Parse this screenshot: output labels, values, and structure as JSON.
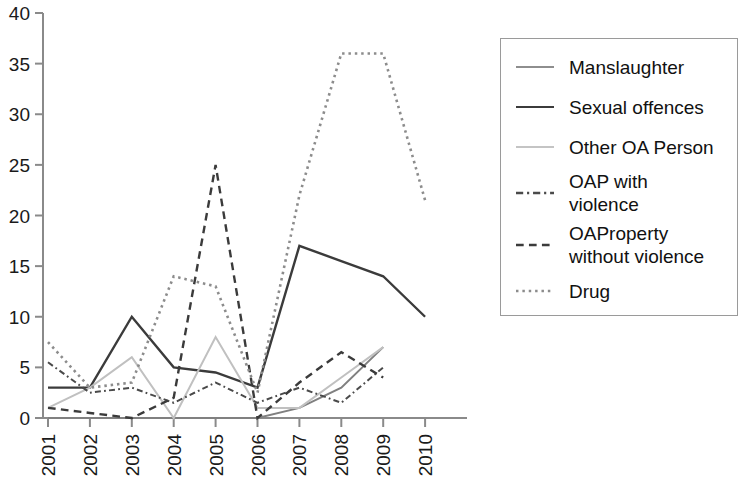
{
  "chart_data": {
    "type": "line",
    "title": "",
    "xlabel": "",
    "ylabel": "",
    "x": [
      "2001",
      "2002",
      "2003",
      "2004",
      "2005",
      "2006",
      "2007",
      "2008",
      "2009",
      "2010"
    ],
    "categories": [
      "2001",
      "2002",
      "2003",
      "2004",
      "2005",
      "2006",
      "2007",
      "2008",
      "2009",
      "2010"
    ],
    "ylim": [
      0,
      40
    ],
    "yticks": [
      0,
      5,
      10,
      15,
      20,
      25,
      30,
      35,
      40
    ],
    "ytick_labels": [
      "0",
      "5",
      "10",
      "15",
      "20",
      "25",
      "30",
      "35",
      "40"
    ],
    "xtick_labels": [
      "2001",
      "2002",
      "2003",
      "2004",
      "2005",
      "2006",
      "2007",
      "2008",
      "2009",
      "2010"
    ],
    "grid": false,
    "legend_position": "right",
    "series": [
      {
        "name": "Manslaughter",
        "style": "solid",
        "color": "#808080",
        "width": 2,
        "values": [
          0,
          0,
          0,
          0,
          0,
          0,
          1,
          3,
          7,
          null
        ]
      },
      {
        "name": "Sexual offences",
        "style": "solid",
        "color": "#3b3b3b",
        "width": 2.4,
        "values": [
          3,
          3,
          10,
          5,
          4.5,
          3,
          17,
          15.5,
          14,
          10
        ]
      },
      {
        "name": "Other OA Person",
        "style": "solid",
        "color": "#c0c0c0",
        "width": 2,
        "values": [
          1,
          3,
          6,
          0,
          8,
          1,
          1,
          4,
          7,
          null
        ]
      },
      {
        "name": "OAP with violence",
        "style": "dashdot",
        "color": "#4a4a4a",
        "width": 2,
        "values": [
          5.5,
          2.5,
          3,
          1.5,
          3.5,
          1.5,
          3,
          1.5,
          5,
          null
        ]
      },
      {
        "name": "OAProperty without violence",
        "style": "dashed",
        "color": "#3b3b3b",
        "width": 2.4,
        "values": [
          1,
          0.5,
          0,
          2,
          25,
          0,
          3.5,
          6.5,
          4,
          null
        ]
      },
      {
        "name": "Drug",
        "style": "dotted",
        "color": "#8c8c8c",
        "width": 2.6,
        "values": [
          7.5,
          3,
          3.5,
          14,
          13,
          2.5,
          22,
          36,
          36,
          21.5
        ]
      }
    ]
  },
  "legend": {
    "items": [
      {
        "label": "Manslaughter",
        "style": "solid",
        "color": "#8e8e8e"
      },
      {
        "label": "Sexual offences",
        "style": "solid",
        "color": "#3b3b3b"
      },
      {
        "label": "Other OA Person",
        "style": "solid",
        "color": "#c4c4c4"
      },
      {
        "label": "OAP with\nviolence",
        "style": "dashdot",
        "color": "#4a4a4a"
      },
      {
        "label": "OAProperty\nwithout violence",
        "style": "dashed",
        "color": "#3b3b3b"
      },
      {
        "label": "Drug",
        "style": "dotted",
        "color": "#8c8c8c"
      }
    ]
  },
  "axes": {
    "axis_color": "#8a8a8a",
    "tick_color": "#8a8a8a"
  }
}
